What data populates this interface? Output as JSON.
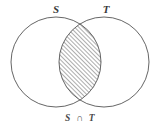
{
  "figure": {
    "type": "venn-diagram",
    "title": "",
    "background_color": "#ffffff",
    "stroke_color": "#555555",
    "hatch_color": "#3c3c3c",
    "label_color": "#3a3a3a",
    "sets": [
      {
        "id": "S",
        "label": "S",
        "cx": 56,
        "cy": 62,
        "r": 45
      },
      {
        "id": "T",
        "label": "T",
        "cx": 104,
        "cy": 62,
        "r": 45
      }
    ],
    "labels": {
      "left_set": "S",
      "right_set": "T",
      "caption": "S ∩ T",
      "caption_left": "S",
      "caption_operator": "∩",
      "caption_right": "T"
    },
    "shaded_region": {
      "name": "intersection",
      "notation": "S ∩ T",
      "fill_style": "diagonal-hatch",
      "hatch_angle_deg": 45,
      "hatch_spacing_px": 3
    }
  }
}
